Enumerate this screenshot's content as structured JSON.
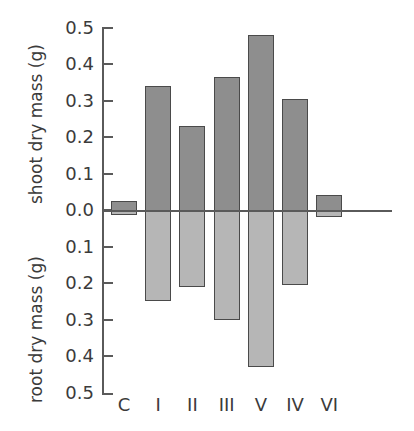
{
  "chart_data": {
    "type": "bar",
    "title": "",
    "subtitle": "",
    "orientation": "vertical",
    "layout": "back-to-back bidirectional bar chart (shoot above zero, root below zero)",
    "xlabel": "",
    "categories": [
      "C",
      "I",
      "II",
      "III",
      "V",
      "IV",
      "VI"
    ],
    "axes": {
      "upper": {
        "ylabel": "shoot dry mass (g)",
        "ticks": [
          "0.5",
          "0.4",
          "0.3",
          "0.2",
          "0.1",
          "0.0"
        ],
        "tick_values": [
          0.5,
          0.4,
          0.3,
          0.2,
          0.1,
          0.0
        ],
        "ylim": [
          0.0,
          0.5
        ],
        "direction": "increasing upward"
      },
      "lower": {
        "ylabel": "root dry mass (g)",
        "ticks": [
          "0.0",
          "0.1",
          "0.2",
          "0.3",
          "0.4",
          "0.5"
        ],
        "tick_values": [
          0.0,
          0.1,
          0.2,
          0.3,
          0.4,
          0.5
        ],
        "ylim": [
          0.0,
          0.5
        ],
        "direction": "increasing downward"
      }
    },
    "grid": false,
    "legend": "none",
    "series": [
      {
        "name": "shoot dry mass (g)",
        "color": "#8e8e8e",
        "direction": "up",
        "values": [
          0.025,
          0.34,
          0.23,
          0.365,
          0.48,
          0.305,
          0.04
        ]
      },
      {
        "name": "root dry mass (g)",
        "color": "#b6b6b6",
        "direction": "down",
        "values": [
          0.015,
          0.25,
          0.21,
          0.3,
          0.43,
          0.205,
          0.02
        ]
      }
    ],
    "colors": {
      "shoot_bar": "#8e8e8e",
      "root_bar": "#b6b6b6",
      "bar_outline": "#4a4a4a",
      "axis": "#5a5a5a",
      "text": "#3b3b3b",
      "background": "#ffffff"
    }
  },
  "tick_labels": {
    "upper": [
      "0.5",
      "0.4",
      "0.3",
      "0.2",
      "0.1",
      "0.0"
    ],
    "lower": [
      "0.1",
      "0.2",
      "0.3",
      "0.4",
      "0.5"
    ]
  },
  "axis_titles": {
    "shoot": "shoot dry mass (g)",
    "root": "root dry mass (g)"
  },
  "category_labels": [
    "C",
    "I",
    "II",
    "III",
    "V",
    "IV",
    "VI"
  ]
}
